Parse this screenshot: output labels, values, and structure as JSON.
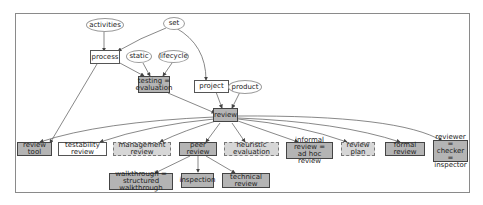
{
  "diagram": {
    "type": "directed-graph",
    "colors": {
      "gray_fill": "#b4b4b4",
      "light_fill": "#d6d6d6",
      "white_fill": "#ffffff",
      "edge": "#444444"
    },
    "nodes": [
      {
        "id": "activities",
        "label": "activities",
        "shape": "ellipse"
      },
      {
        "id": "set",
        "label": "set",
        "shape": "ellipse"
      },
      {
        "id": "process",
        "label": "process",
        "shape": "rect-white"
      },
      {
        "id": "static",
        "label": "static",
        "shape": "ellipse"
      },
      {
        "id": "lifecycle",
        "label": "lifecycle",
        "shape": "ellipse"
      },
      {
        "id": "testing",
        "label": "testing =\nevaluation",
        "shape": "rect-gray"
      },
      {
        "id": "project",
        "label": "project",
        "shape": "rect-white"
      },
      {
        "id": "product",
        "label": "product",
        "shape": "ellipse"
      },
      {
        "id": "review",
        "label": "review",
        "shape": "rect-gray"
      },
      {
        "id": "review_tool",
        "label": "review tool",
        "shape": "rect-gray"
      },
      {
        "id": "testability_review",
        "label": "testability review",
        "shape": "rect-white"
      },
      {
        "id": "management_review",
        "label": "management review",
        "shape": "rect-dashed"
      },
      {
        "id": "peer_review",
        "label": "peer review",
        "shape": "rect-gray"
      },
      {
        "id": "heuristic_evaluation",
        "label": "heuristic evaluation",
        "shape": "rect-dashed"
      },
      {
        "id": "informal_review",
        "label": "informal review =\nad hoc review",
        "shape": "rect-gray"
      },
      {
        "id": "review_plan",
        "label": "review plan",
        "shape": "rect-dashed"
      },
      {
        "id": "formal_review",
        "label": "formal review",
        "shape": "rect-gray"
      },
      {
        "id": "reviewer",
        "label": "reviewer =\nchecker =\ninspector",
        "shape": "rect-gray"
      },
      {
        "id": "walkthrough",
        "label": "walkthrough =\nstructured walkthrough",
        "shape": "rect-gray"
      },
      {
        "id": "inspection",
        "label": "inspection",
        "shape": "rect-gray"
      },
      {
        "id": "technical_review",
        "label": "technical review",
        "shape": "rect-gray"
      }
    ],
    "edges": [
      [
        "activities",
        "process"
      ],
      [
        "set",
        "process"
      ],
      [
        "set",
        "project"
      ],
      [
        "process",
        "testing"
      ],
      [
        "static",
        "testing"
      ],
      [
        "lifecycle",
        "testing"
      ],
      [
        "process",
        "review_tool"
      ],
      [
        "testing",
        "review"
      ],
      [
        "project",
        "review"
      ],
      [
        "product",
        "review"
      ],
      [
        "review",
        "review_tool"
      ],
      [
        "review",
        "testability_review"
      ],
      [
        "review",
        "management_review"
      ],
      [
        "review",
        "peer_review"
      ],
      [
        "review",
        "heuristic_evaluation"
      ],
      [
        "review",
        "informal_review"
      ],
      [
        "review",
        "review_plan"
      ],
      [
        "review",
        "formal_review"
      ],
      [
        "review",
        "reviewer"
      ],
      [
        "peer_review",
        "walkthrough"
      ],
      [
        "peer_review",
        "inspection"
      ],
      [
        "peer_review",
        "technical_review"
      ]
    ]
  }
}
